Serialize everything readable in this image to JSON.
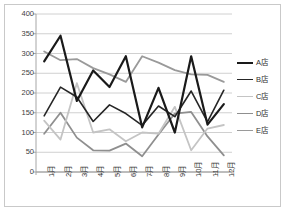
{
  "chart_data": {
    "type": "line",
    "title": "",
    "xlabel": "",
    "ylabel": "",
    "categories": [
      "1月",
      "2月",
      "3月",
      "4月",
      "5月",
      "6月",
      "7月",
      "8月",
      "9月",
      "10月",
      "11月",
      "12月"
    ],
    "ylim": [
      0,
      400
    ],
    "yticks": [
      0,
      50,
      100,
      150,
      200,
      250,
      300,
      350,
      400
    ],
    "ytick_labels": [
      "0",
      "50",
      "100",
      "150",
      "200",
      "250",
      "300",
      "350",
      "400"
    ],
    "grid": true,
    "grid_axis": "y",
    "legend_position": "right",
    "series": [
      {
        "name": "A店",
        "color": "#1a1a1a",
        "width": 2.2,
        "values": [
          280,
          345,
          180,
          257,
          215,
          293,
          113,
          213,
          100,
          293,
          120,
          172
        ]
      },
      {
        "name": "B店",
        "color": "#262626",
        "width": 1.6,
        "values": [
          142,
          215,
          190,
          128,
          170,
          148,
          118,
          167,
          140,
          205,
          127,
          207
        ]
      },
      {
        "name": "C店",
        "color": "#c4c4c4",
        "width": 1.8,
        "values": [
          130,
          82,
          225,
          100,
          108,
          78,
          100,
          97,
          165,
          55,
          110,
          119
        ]
      },
      {
        "name": "D店",
        "color": "#8f8f8f",
        "width": 1.8,
        "values": [
          97,
          150,
          87,
          55,
          54,
          72,
          40,
          95,
          148,
          152,
          90,
          42
        ]
      },
      {
        "name": "E店",
        "color": "#9a9a9a",
        "width": 1.8,
        "values": [
          305,
          283,
          286,
          263,
          247,
          228,
          293,
          277,
          258,
          247,
          246,
          228
        ]
      }
    ]
  },
  "axes": {
    "axis_color": "#a6a6a6",
    "grid_color": "#d0d0d0",
    "tick_label_color": "#404040"
  }
}
